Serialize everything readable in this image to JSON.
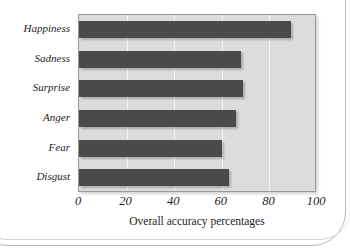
{
  "chart_data": {
    "type": "bar",
    "orientation": "horizontal",
    "title": "",
    "xlabel": "Overall accuracy percentages",
    "ylabel": "",
    "categories": [
      "Happiness",
      "Sadness",
      "Surprise",
      "Anger",
      "Fear",
      "Disgust"
    ],
    "values": [
      89,
      68,
      69,
      66,
      60,
      63
    ],
    "xlim": [
      0,
      100
    ],
    "xticks": [
      0,
      20,
      40,
      60,
      80,
      100
    ],
    "xtick_labels": [
      "0",
      "20",
      "40",
      "60",
      "80",
      "100"
    ],
    "grid": true,
    "grid_axis": "x",
    "legend": null,
    "series": [
      {
        "name": "Overall accuracy",
        "values": [
          89,
          68,
          69,
          66,
          60,
          63
        ]
      }
    ],
    "colors": {
      "bar": "#4a4a4a",
      "plot_background": "#dcdcdc",
      "gridline": "#f4f4f4",
      "axis_border": "#9a9a9a",
      "text": "#1d1d1d",
      "page_background": "#ffffff"
    }
  }
}
